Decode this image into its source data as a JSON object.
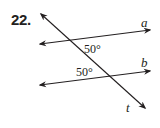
{
  "problem": {
    "number": "22."
  },
  "figure": {
    "lines": {
      "a": {
        "label": "a"
      },
      "b": {
        "label": "b"
      },
      "t": {
        "label": "t"
      }
    },
    "angles": [
      {
        "id": "angle-upper",
        "value": "50°",
        "position": "below line a, right of t"
      },
      {
        "id": "angle-lower",
        "value": "50°",
        "position": "above line b, left of t"
      }
    ],
    "colors": {
      "ink": "#231f20",
      "background": "#ffffff"
    }
  }
}
